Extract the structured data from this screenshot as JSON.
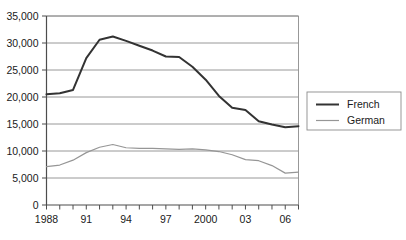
{
  "chart_data": {
    "type": "line",
    "title": "",
    "subtitle": "",
    "xlabel": "",
    "ylabel": "",
    "x": [
      1988,
      1989,
      1990,
      1991,
      1992,
      1993,
      1994,
      1995,
      1996,
      1997,
      1998,
      1999,
      2000,
      2001,
      2002,
      2003,
      2004,
      2005,
      2006,
      2007
    ],
    "xlim": [
      1988,
      2007
    ],
    "ylim": [
      0,
      35000
    ],
    "grid": true,
    "legend_position": "right",
    "series": [
      {
        "name": "French",
        "color": "#333333",
        "width": 2.0,
        "values": [
          20500,
          20700,
          21300,
          27200,
          30600,
          31200,
          30400,
          29500,
          28600,
          27500,
          27400,
          25600,
          23200,
          20200,
          18000,
          17600,
          15500,
          14900,
          14400,
          14600
        ]
      },
      {
        "name": "German",
        "color": "#969696",
        "width": 1.2,
        "values": [
          7100,
          7400,
          8300,
          9700,
          10700,
          11200,
          10600,
          10500,
          10500,
          10400,
          10300,
          10400,
          10200,
          9900,
          9300,
          8400,
          8200,
          7300,
          5900,
          6100
        ]
      }
    ],
    "y_ticks": [
      {
        "value": 0,
        "label": "0"
      },
      {
        "value": 5000,
        "label": "5,000"
      },
      {
        "value": 10000,
        "label": "10,000"
      },
      {
        "value": 15000,
        "label": "15,000"
      },
      {
        "value": 20000,
        "label": "20,000"
      },
      {
        "value": 25000,
        "label": "25,000"
      },
      {
        "value": 30000,
        "label": "30,000"
      },
      {
        "value": 35000,
        "label": "35,000"
      }
    ],
    "x_ticks": [
      {
        "value": 1988,
        "label": "1988"
      },
      {
        "value": 1991,
        "label": "91"
      },
      {
        "value": 1994,
        "label": "94"
      },
      {
        "value": 1997,
        "label": "97"
      },
      {
        "value": 2000,
        "label": "2000"
      },
      {
        "value": 2003,
        "label": "03"
      },
      {
        "value": 2006,
        "label": "06"
      }
    ],
    "legend": [
      {
        "label": "French",
        "color": "#333333",
        "width": 2.0
      },
      {
        "label": "German",
        "color": "#969696",
        "width": 1.2
      }
    ],
    "colors": {
      "french": "#333333",
      "german": "#969696",
      "gridline": "#8c8c8c",
      "axis": "#4d4d4d",
      "background": "#ffffff",
      "text": "#1a1a1a"
    }
  }
}
